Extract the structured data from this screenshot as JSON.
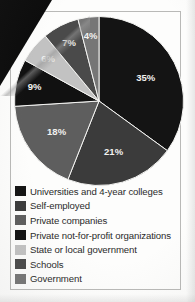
{
  "figure": {
    "frame_color": "#b9b9b7",
    "background": "#fdfdfc"
  },
  "chart_data": {
    "type": "pie",
    "title": "",
    "subtitle": "",
    "xlabel": "",
    "ylabel": "",
    "legend_position": "bottom",
    "grid": false,
    "value_suffix": "%",
    "start_angle_deg": 0,
    "direction": "clockwise",
    "categories": [
      "Universities and 4-year colleges",
      "Self-employed",
      "Private companies",
      "Private not-for-profit organizations",
      "State or local government",
      "Schools",
      "Government"
    ],
    "values": [
      35,
      21,
      18,
      9,
      6,
      7,
      4
    ],
    "labels": [
      "35%",
      "21%",
      "18%",
      "9%",
      "6%",
      "7%",
      "4%"
    ],
    "colors": [
      "#141414",
      "#3b3b3b",
      "#5e5e5e",
      "#111111",
      "#c2c2c2",
      "#4a4a4a",
      "#767676"
    ],
    "slices": [
      {
        "label": "Universities and 4-year colleges",
        "value": 35,
        "display": "35%",
        "color": "#141414"
      },
      {
        "label": "Self-employed",
        "value": 21,
        "display": "21%",
        "color": "#3b3b3b"
      },
      {
        "label": "Private companies",
        "value": 18,
        "display": "18%",
        "color": "#5e5e5e"
      },
      {
        "label": "Private not-for-profit organizations",
        "value": 9,
        "display": "9%",
        "color": "#111111"
      },
      {
        "label": "State or local government",
        "value": 6,
        "display": "6%",
        "color": "#c2c2c2"
      },
      {
        "label": "Schools",
        "value": 7,
        "display": "7%",
        "color": "#4a4a4a"
      },
      {
        "label": "Government",
        "value": 4,
        "display": "4%",
        "color": "#767676"
      }
    ]
  },
  "legend": {
    "items": [
      {
        "label": "Universities and 4-year colleges",
        "color": "#141414"
      },
      {
        "label": "Self-employed",
        "color": "#3b3b3b"
      },
      {
        "label": "Private companies",
        "color": "#5e5e5e"
      },
      {
        "label": "Private not-for-profit organizations",
        "color": "#111111"
      },
      {
        "label": "State or local government",
        "color": "#c2c2c2"
      },
      {
        "label": "Schools",
        "color": "#4a4a4a"
      },
      {
        "label": "Government",
        "color": "#767676"
      }
    ]
  }
}
